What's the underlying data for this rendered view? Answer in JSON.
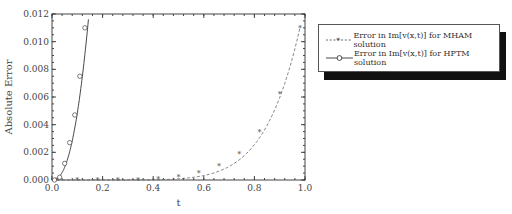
{
  "chart_data": {
    "type": "line",
    "title": "",
    "xlabel": "t",
    "ylabel": "Absolute Error",
    "xlim": [
      0.0,
      1.0
    ],
    "ylim": [
      0.0,
      0.012
    ],
    "xticks": [
      "0.0",
      "0.2",
      "0.4",
      "0.6",
      "0.8",
      "1.0"
    ],
    "yticks": [
      "0.000",
      "0.002",
      "0.004",
      "0.006",
      "0.008",
      "0.010",
      "0.012"
    ],
    "grid": false,
    "legend_position": "right-outside",
    "series": [
      {
        "name": "Error in Im[v(x,t)] for MHAM solution",
        "style": "dashed with star markers",
        "x": [
          0.02,
          0.1,
          0.18,
          0.26,
          0.34,
          0.42,
          0.5,
          0.58,
          0.66,
          0.74,
          0.82,
          0.9,
          0.98
        ],
        "y": [
          0.0,
          0.0,
          0.0,
          0.0,
          2e-05,
          0.0001,
          0.0002,
          0.0005,
          0.001,
          0.0019,
          0.0035,
          0.0062,
          0.011
        ]
      },
      {
        "name": "Error in Im[v(x,t)] for HPTM solution",
        "style": "solid with circle markers",
        "x": [
          0.01,
          0.03,
          0.05,
          0.07,
          0.09,
          0.11,
          0.13,
          0.145
        ],
        "y": [
          0.0,
          0.0002,
          0.0012,
          0.0027,
          0.0047,
          0.0075,
          0.011,
          0.012
        ]
      }
    ]
  },
  "legend": {
    "items": [
      {
        "label": "Error in Im[v(x,t)] for MHAM solution"
      },
      {
        "label": "Error in Im[v(x,t)] for HPTM solution"
      }
    ]
  }
}
